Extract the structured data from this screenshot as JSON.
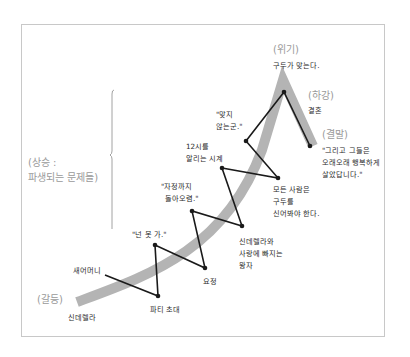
{
  "colors": {
    "band": "#b4b4b4",
    "path": "#1a1a1a",
    "stage_text": "#9a9a9a",
    "label_text": "#2a2a2a",
    "frame": "#c8c8c8"
  },
  "stages": {
    "conflict": "(갈등)",
    "rising_line1": "(상승 :",
    "rising_line2": "파생되는 문제들)",
    "crisis": "(위기)",
    "falling": "(하강)",
    "ending": "(결말)"
  },
  "events": {
    "cinderella": "신데렐라",
    "stepmother": "새어머니",
    "party_invite": "파티 초대",
    "you_cant_go": "\"넌 못 가.\"",
    "fairy": "요정",
    "until_midnight_1": "\"자정까지",
    "until_midnight_2": "돌아오렴.\"",
    "prince_1": "신데렐라와",
    "prince_2": "사랑에 빠지는",
    "prince_3": "왕자",
    "clock_1": "12시를",
    "clock_2": "알리는 시계",
    "everyone_1": "모든 사람은",
    "everyone_2": "구두를",
    "everyone_3": "신어봐야 한다.",
    "doesnt_fit_1": "\"맞지",
    "doesnt_fit_2": "않는군.\"",
    "shoe_fits": "구두가 맞는다.",
    "marriage": "결혼",
    "happy_1": "\"그리고 그들은",
    "happy_2": "오래오래 행복하게",
    "happy_3": "살았답니다.\""
  }
}
